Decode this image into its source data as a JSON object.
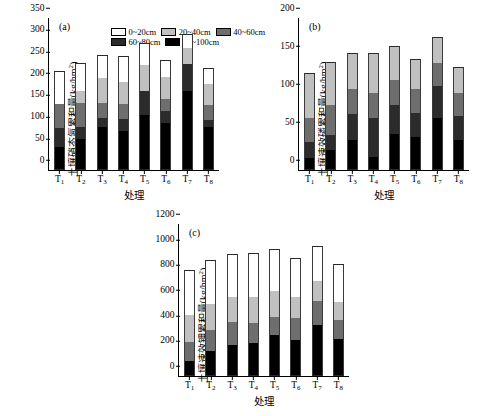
{
  "figure": {
    "panels": [
      "a",
      "b",
      "c"
    ],
    "xlabel": "处理",
    "categories": [
      "T1",
      "T2",
      "T3",
      "T4",
      "T5",
      "T6",
      "T7",
      "T8"
    ]
  },
  "legend": {
    "items": [
      {
        "label": "0~20cm",
        "color": "#ffffff"
      },
      {
        "label": "20~40cm",
        "color": "#c0c0c0"
      },
      {
        "label": "40~60cm",
        "color": "#6e6e6e"
      },
      {
        "label": "60~80cm",
        "color": "#2b2b2b"
      },
      {
        "label": "80~100cm",
        "color": "#000000"
      }
    ]
  },
  "panel_a": {
    "letter": "(a)",
    "ylabel_main": "土壤硝态氮累积量(kg/hm",
    "ylabel_sup": "2",
    "ylabel_tail": ")",
    "xlabel": "处理",
    "yticks": [
      0,
      50,
      100,
      150,
      200,
      250,
      300,
      350
    ]
  },
  "panel_b": {
    "letter": "(b)",
    "ylabel_main": "土壤速效磷累积量(kg/hm",
    "ylabel_sup": "2",
    "ylabel_tail": ")",
    "xlabel": "处理",
    "yticks": [
      0,
      50,
      100,
      150,
      200
    ]
  },
  "panel_c": {
    "letter": "(c)",
    "ylabel_main": "土壤速效钾累积量(kg/hm",
    "ylabel_sup": "2",
    "ylabel_tail": ")",
    "xlabel": "处理",
    "yticks": [
      0,
      200,
      400,
      600,
      800,
      1000,
      1200
    ]
  },
  "chart_data": [
    {
      "type": "bar",
      "panel": "a",
      "stacked": true,
      "title": "(a)",
      "xlabel": "处理",
      "ylabel": "土壤硝态氮累积量(kg/hm2)",
      "ylim": [
        0,
        350
      ],
      "ytick_step": 50,
      "grid": false,
      "legend_position": "top",
      "categories": [
        "T1",
        "T2",
        "T3",
        "T4",
        "T5",
        "T6",
        "T7",
        "T8"
      ],
      "series": [
        {
          "name": "80~100cm",
          "color": "#000000",
          "values": [
            54,
            71,
            99,
            90,
            126,
            109,
            181,
            98
          ]
        },
        {
          "name": "60~80cm",
          "color": "#2b2b2b",
          "values": [
            42,
            29,
            21,
            27,
            57,
            27,
            62,
            17
          ]
        },
        {
          "name": "40~60cm",
          "color": "#6e6e6e",
          "values": [
            57,
            55,
            35,
            36,
            0,
            27,
            0,
            34
          ]
        },
        {
          "name": "20~40cm",
          "color": "#c0c0c0",
          "values": [
            0,
            27,
            56,
            50,
            58,
            51,
            38,
            48
          ]
        },
        {
          "name": "0~20cm",
          "color": "#ffffff",
          "values": [
            76,
            65,
            54,
            60,
            51,
            40,
            32,
            38
          ]
        }
      ],
      "totals": [
        229,
        247,
        265,
        263,
        292,
        254,
        313,
        235
      ]
    },
    {
      "type": "bar",
      "panel": "b",
      "stacked": true,
      "title": "(b)",
      "xlabel": "处理",
      "ylabel": "土壤速效磷累积量(kg/hm2)",
      "ylim": [
        0,
        200
      ],
      "ytick_step": 50,
      "grid": false,
      "legend_position": "none",
      "categories": [
        "T1",
        "T2",
        "T3",
        "T4",
        "T5",
        "T6",
        "T7",
        "T8"
      ],
      "series": [
        {
          "name": "80~100cm",
          "color": "#000000",
          "values": [
            16,
            26,
            39,
            17,
            48,
            43,
            68,
            40
          ]
        },
        {
          "name": "60~80cm",
          "color": "#2b2b2b",
          "values": [
            21,
            20,
            35,
            52,
            37,
            32,
            42,
            31
          ]
        },
        {
          "name": "40~60cm",
          "color": "#6e6e6e",
          "values": [
            32,
            39,
            32,
            33,
            34,
            32,
            31,
            30
          ]
        },
        {
          "name": "20~40cm",
          "color": "#c0c0c0",
          "values": [
            59,
            57,
            48,
            52,
            44,
            39,
            34,
            35
          ]
        },
        {
          "name": "0~20cm",
          "color": "#ffffff",
          "values": [
            0,
            0,
            0,
            0,
            0,
            0,
            0,
            0
          ]
        }
      ],
      "totals": [
        128,
        142,
        154,
        154,
        163,
        146,
        175,
        136
      ]
    },
    {
      "type": "bar",
      "panel": "c",
      "stacked": true,
      "title": "(c)",
      "xlabel": "处理",
      "ylabel": "土壤速效钾累积量(kg/hm2)",
      "ylim": [
        0,
        1200
      ],
      "ytick_step": 200,
      "grid": false,
      "legend_position": "none",
      "categories": [
        "T1",
        "T2",
        "T3",
        "T4",
        "T5",
        "T6",
        "T7",
        "T8"
      ],
      "series": [
        {
          "name": "80~100cm",
          "color": "#000000",
          "values": [
            120,
            200,
            245,
            258,
            325,
            283,
            405,
            295
          ]
        },
        {
          "name": "60~80cm",
          "color": "#2b2b2b",
          "values": [
            0,
            0,
            0,
            0,
            0,
            0,
            0,
            0
          ]
        },
        {
          "name": "40~60cm",
          "color": "#6e6e6e",
          "values": [
            145,
            165,
            185,
            162,
            140,
            172,
            185,
            150
          ]
        },
        {
          "name": "20~40cm",
          "color": "#c0c0c0",
          "values": [
            215,
            200,
            190,
            200,
            205,
            165,
            160,
            140
          ]
        },
        {
          "name": "0~20cm",
          "color": "#ffffff",
          "values": [
            360,
            350,
            340,
            350,
            330,
            310,
            275,
            300
          ]
        }
      ],
      "totals": [
        840,
        915,
        960,
        970,
        1000,
        930,
        1025,
        885
      ]
    }
  ]
}
